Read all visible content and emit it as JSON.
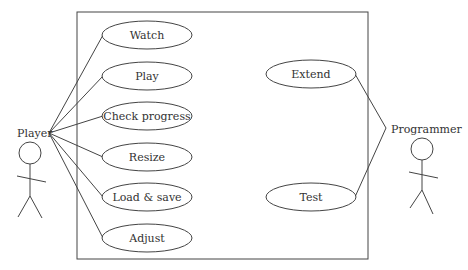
{
  "diagram": {
    "type": "use-case",
    "actors": [
      {
        "id": "player",
        "label": "Player"
      },
      {
        "id": "programmer",
        "label": "Programmer"
      }
    ],
    "use_cases": [
      {
        "id": "watch",
        "label": "Watch",
        "actor": "player"
      },
      {
        "id": "play",
        "label": "Play",
        "actor": "player"
      },
      {
        "id": "check-progress",
        "label": "Check progress",
        "actor": "player"
      },
      {
        "id": "resize",
        "label": "Resize",
        "actor": "player"
      },
      {
        "id": "load-save",
        "label": "Load & save",
        "actor": "player"
      },
      {
        "id": "adjust",
        "label": "Adjust",
        "actor": "player"
      },
      {
        "id": "extend",
        "label": "Extend",
        "actor": "programmer"
      },
      {
        "id": "test",
        "label": "Test",
        "actor": "programmer"
      }
    ]
  }
}
